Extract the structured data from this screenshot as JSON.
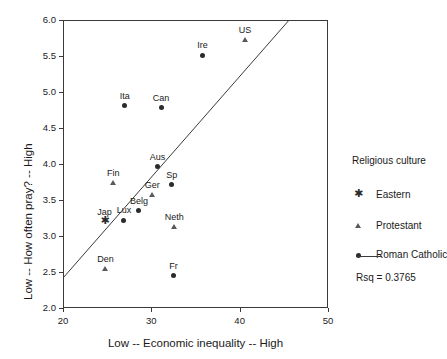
{
  "chart_data": {
    "type": "scatter",
    "title": "",
    "xlabel": "Low -- Economic inequality -- High",
    "ylabel": "Low -- How often pray? -- High",
    "xlim": [
      20,
      50
    ],
    "ylim": [
      2.0,
      6.0
    ],
    "xticks": [
      20,
      30,
      40,
      50
    ],
    "yticks": [
      "2.0",
      "2.5",
      "3.0",
      "3.5",
      "4.0",
      "4.5",
      "5.0",
      "5.5",
      "6.0"
    ],
    "grid": false,
    "legend_position": "right",
    "legend_title": "Religious culture",
    "legend_entries": [
      {
        "label": "Eastern",
        "marker": "asterisk"
      },
      {
        "label": "Protestant",
        "marker": "triangle"
      },
      {
        "label": "Roman Catholic",
        "marker": "circle"
      }
    ],
    "annotations": [
      {
        "text": "Rsq = 0.3765",
        "name": "rsq-annotation"
      }
    ],
    "fit_line": {
      "type": "linear-regression",
      "x_start": 20.1,
      "y_start": 2.43,
      "x_end": 45.6,
      "y_end": 6.0,
      "rsq": 0.3765
    },
    "points": [
      {
        "label": "US",
        "x": 40.6,
        "y": 5.72,
        "group": "Protestant",
        "marker": "triangle"
      },
      {
        "label": "Ire",
        "x": 35.8,
        "y": 5.51,
        "group": "Roman Catholic",
        "marker": "circle"
      },
      {
        "label": "Ita",
        "x": 27.0,
        "y": 4.81,
        "group": "Roman Catholic",
        "marker": "circle"
      },
      {
        "label": "Can",
        "x": 31.1,
        "y": 4.78,
        "group": "Roman Catholic",
        "marker": "circle"
      },
      {
        "label": "Aus",
        "x": 30.7,
        "y": 3.96,
        "group": "Roman Catholic",
        "marker": "circle"
      },
      {
        "label": "Fin",
        "x": 25.7,
        "y": 3.74,
        "group": "Protestant",
        "marker": "triangle"
      },
      {
        "label": "Sp",
        "x": 32.3,
        "y": 3.71,
        "group": "Roman Catholic",
        "marker": "circle"
      },
      {
        "label": "Ger",
        "x": 30.1,
        "y": 3.57,
        "group": "Protestant",
        "marker": "triangle"
      },
      {
        "label": "Belg",
        "x": 28.6,
        "y": 3.35,
        "group": "Roman Catholic",
        "marker": "circle"
      },
      {
        "label": "Lux",
        "x": 26.9,
        "y": 3.22,
        "group": "Roman Catholic",
        "marker": "circle"
      },
      {
        "label": "Jap",
        "x": 24.7,
        "y": 3.19,
        "group": "Eastern",
        "marker": "asterisk"
      },
      {
        "label": "Neth",
        "x": 32.6,
        "y": 3.13,
        "group": "Protestant",
        "marker": "triangle"
      },
      {
        "label": "Den",
        "x": 24.8,
        "y": 2.54,
        "group": "Protestant",
        "marker": "triangle"
      },
      {
        "label": "Fr",
        "x": 32.5,
        "y": 2.45,
        "group": "Roman Catholic",
        "marker": "circle"
      }
    ]
  },
  "colors": {
    "axis": "#3a3a3a",
    "circle_marker": "#2b2b2b",
    "triangle_marker": "#5a5a5a",
    "text": "#1a1a1a",
    "background": "#ffffff"
  }
}
